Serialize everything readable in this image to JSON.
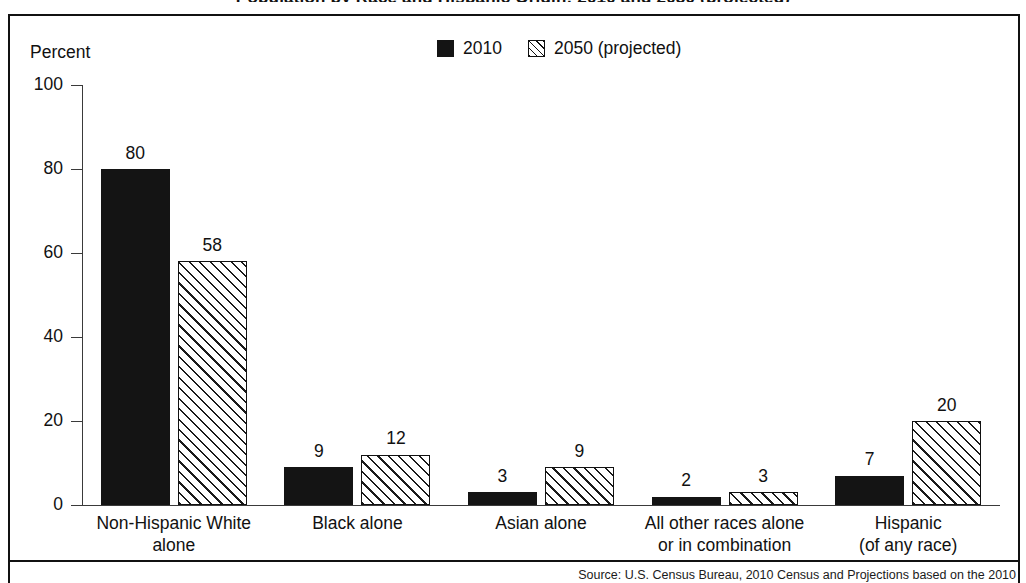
{
  "page": {
    "clipped_title": "Population by Race and Hispanic Origin: 2010 and 2050 (projected)",
    "footnote": "Source: U.S. Census Bureau, 2010 Census and Projections based on the 2010"
  },
  "axis_title": "Percent",
  "legend": {
    "entries": [
      {
        "label": "2010",
        "swatch": "solid-black-swatch-icon",
        "color": "#141414"
      },
      {
        "label": "2050 (projected)",
        "swatch": "diagonal-hatch-swatch-icon",
        "color": "#ffffff"
      }
    ]
  },
  "y_axis": {
    "ticks": [
      {
        "value": 100,
        "label": "100"
      },
      {
        "value": 80,
        "label": "80"
      },
      {
        "value": 60,
        "label": "60"
      },
      {
        "value": 40,
        "label": "40"
      },
      {
        "value": 20,
        "label": "20"
      },
      {
        "value": 0,
        "label": "0"
      }
    ]
  },
  "categories": [
    {
      "lines": [
        "Non-Hispanic White",
        "alone"
      ]
    },
    {
      "lines": [
        "Black alone"
      ]
    },
    {
      "lines": [
        "Asian alone"
      ]
    },
    {
      "lines": [
        "All other races alone",
        "or in combination"
      ]
    },
    {
      "lines": [
        "Hispanic",
        "(of any race)"
      ]
    }
  ],
  "chart_data": {
    "type": "bar",
    "title": "Population by Race and Hispanic Origin: 2010 and 2050 (projected)",
    "xlabel": "",
    "ylabel": "Percent",
    "ylim": [
      0,
      100
    ],
    "yticks": [
      0,
      20,
      40,
      60,
      80,
      100
    ],
    "grid": false,
    "legend_position": "top-center",
    "categories": [
      "Non-Hispanic White alone",
      "Black alone",
      "Asian alone",
      "All other races alone or in combination",
      "Hispanic (of any race)"
    ],
    "series": [
      {
        "name": "2010",
        "values": [
          80,
          9,
          3,
          2,
          7
        ],
        "style": "solid-black"
      },
      {
        "name": "2050 (projected)",
        "values": [
          58,
          12,
          9,
          3,
          20
        ],
        "style": "diagonal-hatch"
      }
    ]
  }
}
